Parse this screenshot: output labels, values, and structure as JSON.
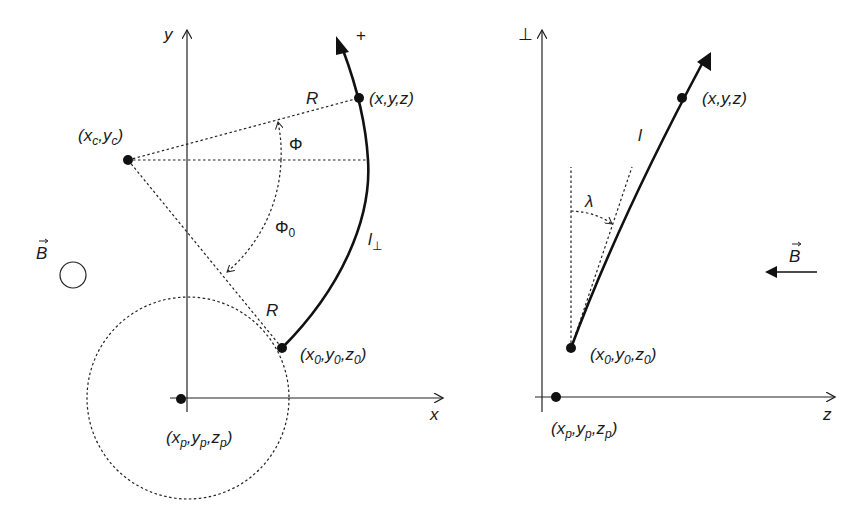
{
  "figure": {
    "left_panel": {
      "title": "transverse projection (x-y plane)",
      "axis_y_label": "y",
      "axis_x_label": "x",
      "direction_sign": "+",
      "field_label": "B",
      "field_symbol": "out-of-plane circle",
      "points": {
        "center": {
          "label_pre": "(x",
          "sub1": "c",
          "mid": ",y",
          "sub2": "c",
          "post": ")"
        },
        "current": {
          "label": "(x,y,z)"
        },
        "start": {
          "label_pre": "(x",
          "sub1": "0",
          "mid1": ",y",
          "sub2": "0",
          "mid2": ",z",
          "sub3": "0",
          "post": ")"
        },
        "reference": {
          "label_pre": "(x",
          "sub1": "p",
          "mid1": ",y",
          "sub2": "p",
          "mid2": ",z",
          "sub3": "p",
          "post": ")"
        }
      },
      "labels": {
        "radius_top": "R",
        "radius_bottom": "R",
        "phi": "Φ",
        "phi0_main": "Φ",
        "phi0_sub": "0",
        "arc_length_main": "l",
        "arc_length_sub": "⊥"
      }
    },
    "right_panel": {
      "title": "longitudinal projection (⊥-z plane)",
      "axis_vertical_label": "⊥",
      "axis_horizontal_label": "z",
      "field_label": "B",
      "points": {
        "current": {
          "label": "(x,y,z)"
        },
        "start": {
          "label_pre": "(x",
          "sub1": "0",
          "mid1": ",y",
          "sub2": "0",
          "mid2": ",z",
          "sub3": "0",
          "post": ")"
        },
        "reference": {
          "label_pre": "(x",
          "sub1": "p",
          "mid1": ",y",
          "sub2": "p",
          "mid2": ",z",
          "sub3": "p",
          "post": ")"
        }
      },
      "labels": {
        "length": "l",
        "dip_angle": "λ"
      }
    },
    "colors": {
      "ink": "#111111",
      "background": "#ffffff"
    }
  }
}
